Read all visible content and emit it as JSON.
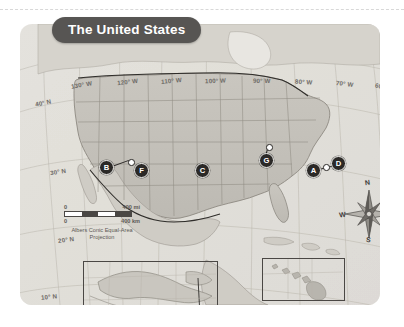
{
  "page": {
    "top_rule": "dashed-divider"
  },
  "map": {
    "title": "The United States",
    "projection_note": "Albers Conic Equal-Area\nProjection",
    "projection_line1": "Albers Conic Equal-Area",
    "projection_line2": "Projection",
    "colors": {
      "title_banner_bg": "#575553",
      "title_text": "#ffffff",
      "plate_bg": "#e9e7e2",
      "marker_bg": "#2b2927",
      "marker_text": "#ffffff",
      "graticule": "#b9b5ad",
      "label_text": "#6d6a66",
      "border_line": "#4a4744"
    },
    "longitude_labels": [
      {
        "text": "130° W",
        "x": 51,
        "y": 57,
        "rot": -10
      },
      {
        "text": "120° W",
        "x": 97,
        "y": 54,
        "rot": -7
      },
      {
        "text": "110° W",
        "x": 141,
        "y": 53,
        "rot": -5
      },
      {
        "text": "100° W",
        "x": 185,
        "y": 53,
        "rot": -2
      },
      {
        "text": "90° W",
        "x": 233,
        "y": 53,
        "rot": 1
      },
      {
        "text": "80° W",
        "x": 275,
        "y": 54,
        "rot": 4
      },
      {
        "text": "70° W",
        "x": 316,
        "y": 56,
        "rot": 7
      },
      {
        "text": "60° W",
        "x": 355,
        "y": 59,
        "rot": 11
      }
    ],
    "latitude_labels": [
      {
        "text": "40° N",
        "x": 35,
        "y": 99,
        "rot": -12
      },
      {
        "text": "30° N",
        "x": 50,
        "y": 168,
        "rot": -9
      },
      {
        "text": "20° N",
        "x": 58,
        "y": 236,
        "rot": -7
      },
      {
        "text": "10° N",
        "x": 41,
        "y": 293,
        "rot": -6
      }
    ],
    "scale_bar": {
      "miles_zero": "0",
      "miles_value": "400 mi",
      "km_zero": "0",
      "km_value": "400 km"
    },
    "compass": {
      "north": "N",
      "east": "E",
      "south": "S",
      "west": "W"
    },
    "markers": [
      {
        "label": "A",
        "x": 286,
        "y": 139,
        "leader": {
          "len": 22,
          "angle": -14
        }
      },
      {
        "label": "B",
        "x": 79,
        "y": 136,
        "leader": {
          "len": 19,
          "angle": -20
        }
      },
      {
        "label": "C",
        "x": 175,
        "y": 139,
        "leader": null
      },
      {
        "label": "D",
        "x": 311,
        "y": 132,
        "leader": null
      },
      {
        "label": "E",
        "x": 99,
        "y": 288,
        "leader": null
      },
      {
        "label": "F",
        "x": 114,
        "y": 139,
        "leader": null
      },
      {
        "label": "G",
        "x": 239,
        "y": 129,
        "leader": {
          "len": 11,
          "angle": -72
        }
      }
    ],
    "insets": [
      {
        "name": "alaska-inset",
        "x": 63,
        "y": 237,
        "w": 133,
        "h": 58
      },
      {
        "name": "hawaii-inset",
        "x": 242,
        "y": 234,
        "w": 81,
        "h": 41
      }
    ]
  }
}
